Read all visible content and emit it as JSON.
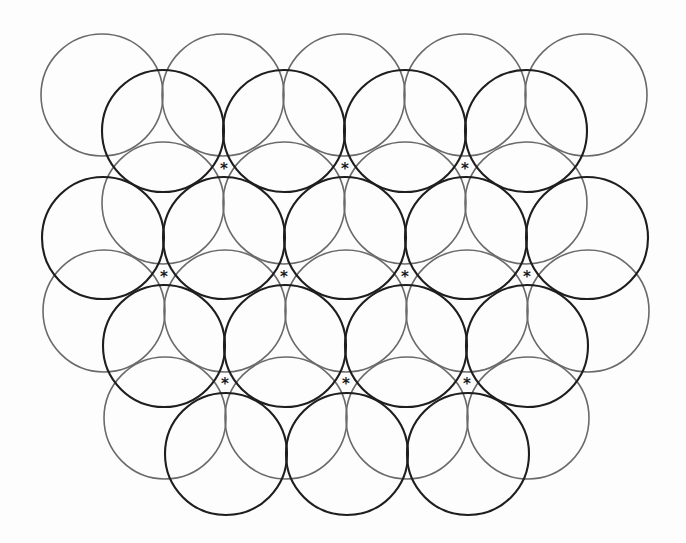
{
  "diagram": {
    "radius": 61,
    "colors": {
      "gray_stroke": "#6a6a6a",
      "dark_stroke": "#1e1e1e",
      "asterisk": "#1a1a1a",
      "background": "#fdfdfd"
    },
    "gray_circles": [
      {
        "cx": 102,
        "cy": 95
      },
      {
        "cx": 223,
        "cy": 95
      },
      {
        "cx": 344,
        "cy": 95
      },
      {
        "cx": 465,
        "cy": 95
      },
      {
        "cx": 586,
        "cy": 95
      },
      {
        "cx": 163,
        "cy": 203
      },
      {
        "cx": 284,
        "cy": 203
      },
      {
        "cx": 405,
        "cy": 203
      },
      {
        "cx": 526,
        "cy": 203
      },
      {
        "cx": 104,
        "cy": 311
      },
      {
        "cx": 225,
        "cy": 311
      },
      {
        "cx": 346,
        "cy": 311
      },
      {
        "cx": 467,
        "cy": 311
      },
      {
        "cx": 588,
        "cy": 311
      },
      {
        "cx": 165,
        "cy": 418
      },
      {
        "cx": 286,
        "cy": 418
      },
      {
        "cx": 407,
        "cy": 418
      },
      {
        "cx": 528,
        "cy": 418
      }
    ],
    "dark_circles": [
      {
        "cx": 163,
        "cy": 131
      },
      {
        "cx": 284,
        "cy": 131
      },
      {
        "cx": 405,
        "cy": 131
      },
      {
        "cx": 526,
        "cy": 131
      },
      {
        "cx": 103,
        "cy": 238
      },
      {
        "cx": 224,
        "cy": 238
      },
      {
        "cx": 345,
        "cy": 238
      },
      {
        "cx": 466,
        "cy": 238
      },
      {
        "cx": 587,
        "cy": 238
      },
      {
        "cx": 164,
        "cy": 346
      },
      {
        "cx": 285,
        "cy": 346
      },
      {
        "cx": 406,
        "cy": 346
      },
      {
        "cx": 527,
        "cy": 346
      },
      {
        "cx": 226,
        "cy": 454
      },
      {
        "cx": 347,
        "cy": 454
      },
      {
        "cx": 468,
        "cy": 454
      }
    ],
    "asterisks": [
      {
        "x": 224,
        "y": 167,
        "label": "*"
      },
      {
        "x": 345,
        "y": 167,
        "label": "*"
      },
      {
        "x": 465,
        "y": 167,
        "label": "*"
      },
      {
        "x": 164,
        "y": 275,
        "label": "*"
      },
      {
        "x": 284,
        "y": 275,
        "label": "*"
      },
      {
        "x": 405,
        "y": 275,
        "label": "*"
      },
      {
        "x": 527,
        "y": 275,
        "label": "*"
      },
      {
        "x": 225,
        "y": 382,
        "label": "*"
      },
      {
        "x": 346,
        "y": 382,
        "label": "*"
      },
      {
        "x": 467,
        "y": 382,
        "label": "*"
      }
    ]
  }
}
